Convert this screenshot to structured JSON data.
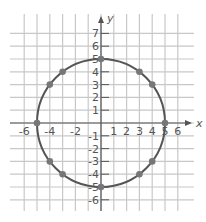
{
  "chart_data": {
    "type": "scatter",
    "title": "",
    "xlabel": "x",
    "ylabel": "y",
    "xlim": [
      -6,
      6
    ],
    "ylim": [
      -6,
      7
    ],
    "grid": true,
    "x_ticks": [
      "-6",
      "-4",
      "-2",
      "1",
      "2",
      "3",
      "4",
      "5",
      "6"
    ],
    "y_ticks": [
      "7",
      "6",
      "5",
      "4",
      "3",
      "2",
      "1",
      "-1",
      "-2",
      "-3",
      "-4",
      "-5",
      "-6"
    ],
    "circle": {
      "center": [
        0,
        0
      ],
      "radius": 5
    },
    "points": [
      [
        0,
        5
      ],
      [
        3,
        4
      ],
      [
        4,
        3
      ],
      [
        5,
        0
      ],
      [
        4,
        -3
      ],
      [
        3,
        -4
      ],
      [
        0,
        -5
      ],
      [
        -3,
        -4
      ],
      [
        -4,
        -3
      ],
      [
        -5,
        0
      ],
      [
        -4,
        3
      ],
      [
        -3,
        4
      ]
    ]
  },
  "colors": {
    "grid": "#c8c8c8",
    "axis": "#555555",
    "curve": "#555555",
    "point": "#777777"
  }
}
